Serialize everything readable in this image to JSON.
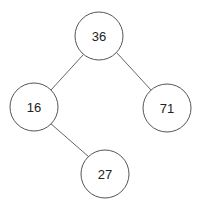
{
  "diagram": {
    "type": "binary-tree",
    "nodes": [
      {
        "id": "n36",
        "label": "36",
        "cx": 99,
        "cy": 36
      },
      {
        "id": "n16",
        "label": "16",
        "cx": 34,
        "cy": 107
      },
      {
        "id": "n71",
        "label": "71",
        "cx": 167,
        "cy": 108
      },
      {
        "id": "n27",
        "label": "27",
        "cx": 105,
        "cy": 174
      }
    ],
    "edges": [
      {
        "from": "36",
        "to": "16"
      },
      {
        "from": "36",
        "to": "71"
      },
      {
        "from": "16",
        "to": "27"
      }
    ],
    "node_radius": 24
  }
}
